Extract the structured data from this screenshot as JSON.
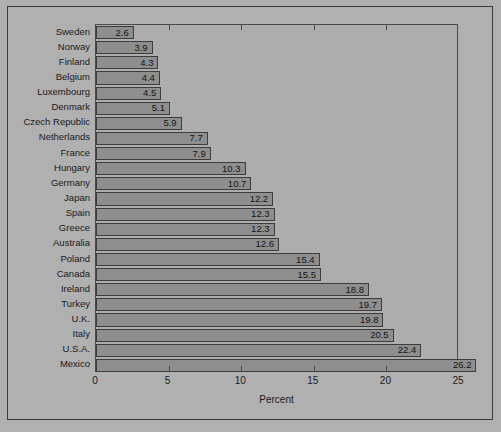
{
  "chart_data": {
    "type": "bar",
    "orientation": "horizontal",
    "title": "",
    "xlabel": "Percent",
    "ylabel": "",
    "xlim": [
      0,
      25
    ],
    "xticks": [
      0,
      5,
      10,
      15,
      20,
      25
    ],
    "xticklabels": [
      "0",
      "5",
      "10",
      "15",
      "20",
      "25"
    ],
    "grid": false,
    "legend": null,
    "categories": [
      "Sweden",
      "Norway",
      "Finland",
      "Belgium",
      "Luxembourg",
      "Denmark",
      "Czech Republic",
      "Netherlands",
      "France",
      "Hungary",
      "Germany",
      "Japan",
      "Spain",
      "Greece",
      "Australia",
      "Poland",
      "Canada",
      "Ireland",
      "Turkey",
      "U.K.",
      "Italy",
      "U.S.A.",
      "Mexico"
    ],
    "values": [
      2.6,
      3.9,
      4.3,
      4.4,
      4.5,
      5.1,
      5.9,
      7.7,
      7.9,
      10.3,
      10.7,
      12.2,
      12.3,
      12.3,
      12.6,
      15.4,
      15.5,
      18.8,
      19.7,
      19.8,
      20.5,
      22.4,
      26.2
    ],
    "value_labels": [
      "2.6",
      "3.9",
      "4.3",
      "4.4",
      "4.5",
      "5.1",
      "5.9",
      "7.7",
      "7.9",
      "10.3",
      "10.7",
      "12.2",
      "12.3",
      "12.3",
      "12.6",
      "15.4",
      "15.5",
      "18.8",
      "19.7",
      "19.8",
      "20.5",
      "22.4",
      "26.2"
    ],
    "colors": {
      "figure_background": "#b0b0b0",
      "plot_background": "#adadad",
      "bar_fill": "#8e8e8e",
      "bar_edge": "#3d3d3d",
      "axis": "#4a4a4a",
      "text": "#1a1a1a"
    }
  }
}
